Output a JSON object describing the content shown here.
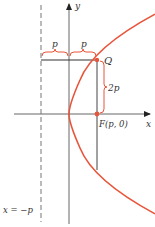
{
  "diagram": {
    "labels": {
      "y_axis": "y",
      "x_axis": "x",
      "point_q": "Q",
      "focus": "F(p, 0)",
      "brace_left": "p",
      "brace_right": "p",
      "brace_vertical": "2p",
      "directrix": "x = −p"
    },
    "colors": {
      "curve": "#e8553a",
      "axis": "#555555",
      "guide": "#333333",
      "brace": "#e8553a"
    }
  }
}
